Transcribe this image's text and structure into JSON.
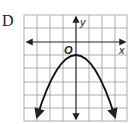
{
  "choice": {
    "label": "D"
  },
  "graph": {
    "x_axis_label": "x",
    "y_axis_label": "y",
    "origin_label": "O",
    "grid": {
      "columns": 8,
      "rows": 8,
      "x_range": [
        -4,
        4
      ],
      "y_range": [
        -8,
        2
      ]
    },
    "curve": {
      "type": "parabola",
      "opens": "down",
      "vertex": [
        0,
        -1
      ],
      "endpoints": [
        [
          -3,
          -7
        ],
        [
          3,
          -7
        ]
      ],
      "equation_estimate": "y = -(2/3)x^2 - 1"
    },
    "colors": {
      "grid": "#9a9a9a",
      "axis": "#222222",
      "curve": "#111111",
      "background": "#ffffff"
    }
  }
}
